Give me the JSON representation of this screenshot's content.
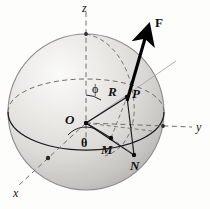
{
  "figure": {
    "caption": "Spherical coordinate diagram of a sphere with force vector F at point P",
    "background_color": "#fdfdfc",
    "sphere": {
      "center_x": 86,
      "center_y": 112,
      "radius": 78,
      "fill_light": "#f2f1ef",
      "fill_mid": "#d8d7d4",
      "fill_dark": "#b9b8b5",
      "outline_color": "#8d8c89"
    },
    "colors": {
      "solid_line": "#1a1a1a",
      "dashed_line": "#6f6e6b",
      "thin_ray": "#a7a6a3",
      "vector": "#000000",
      "text": "#111111"
    }
  },
  "axes": [
    {
      "id": "z",
      "label": "z",
      "label_x": 82,
      "label_y": 2,
      "style": "dashed",
      "orientation": "vertical-up"
    },
    {
      "id": "y",
      "label": "y",
      "label_x": 196,
      "label_y": 128,
      "style": "dashed",
      "orientation": "right"
    },
    {
      "id": "x",
      "label": "x",
      "label_x": 13,
      "label_y": 192,
      "style": "dashed",
      "orientation": "lower-left"
    }
  ],
  "points": [
    {
      "id": "O",
      "label": "O",
      "label_x": 66,
      "label_y": 113,
      "dot_x": 86,
      "dot_y": 123,
      "role": "origin"
    },
    {
      "id": "P",
      "label": "P",
      "label_x": 132,
      "label_y": 92,
      "dot_x": 127,
      "dot_y": 97,
      "role": "point-on-sphere"
    },
    {
      "id": "M",
      "label": "M",
      "label_x": 101,
      "label_y": 143,
      "dot_x": 111,
      "dot_y": 138,
      "role": "projection-midpoint"
    },
    {
      "id": "N",
      "label": "N",
      "label_x": 129,
      "label_y": 160,
      "dot_x": 134,
      "dot_y": 155,
      "role": "equator-projection"
    }
  ],
  "angles": [
    {
      "id": "phi",
      "label": "ϕ",
      "label_x": 93,
      "label_y": 88,
      "description": "polar angle from z-axis"
    },
    {
      "id": "theta",
      "label": "θ",
      "label_x": 82,
      "label_y": 141,
      "description": "azimuthal angle in xy-plane"
    }
  ],
  "segments": [
    {
      "id": "R",
      "label": "R",
      "label_x": 108,
      "label_y": 90,
      "description": "radius from O to P"
    }
  ],
  "vectors": [
    {
      "id": "F",
      "label": "F",
      "label_x": 156,
      "label_y": 20,
      "description": "force vector at P",
      "bold": true
    }
  ],
  "label_sizes": {
    "axis": 12,
    "point": 12,
    "angle": 12,
    "segment": 12,
    "vector": 12
  }
}
